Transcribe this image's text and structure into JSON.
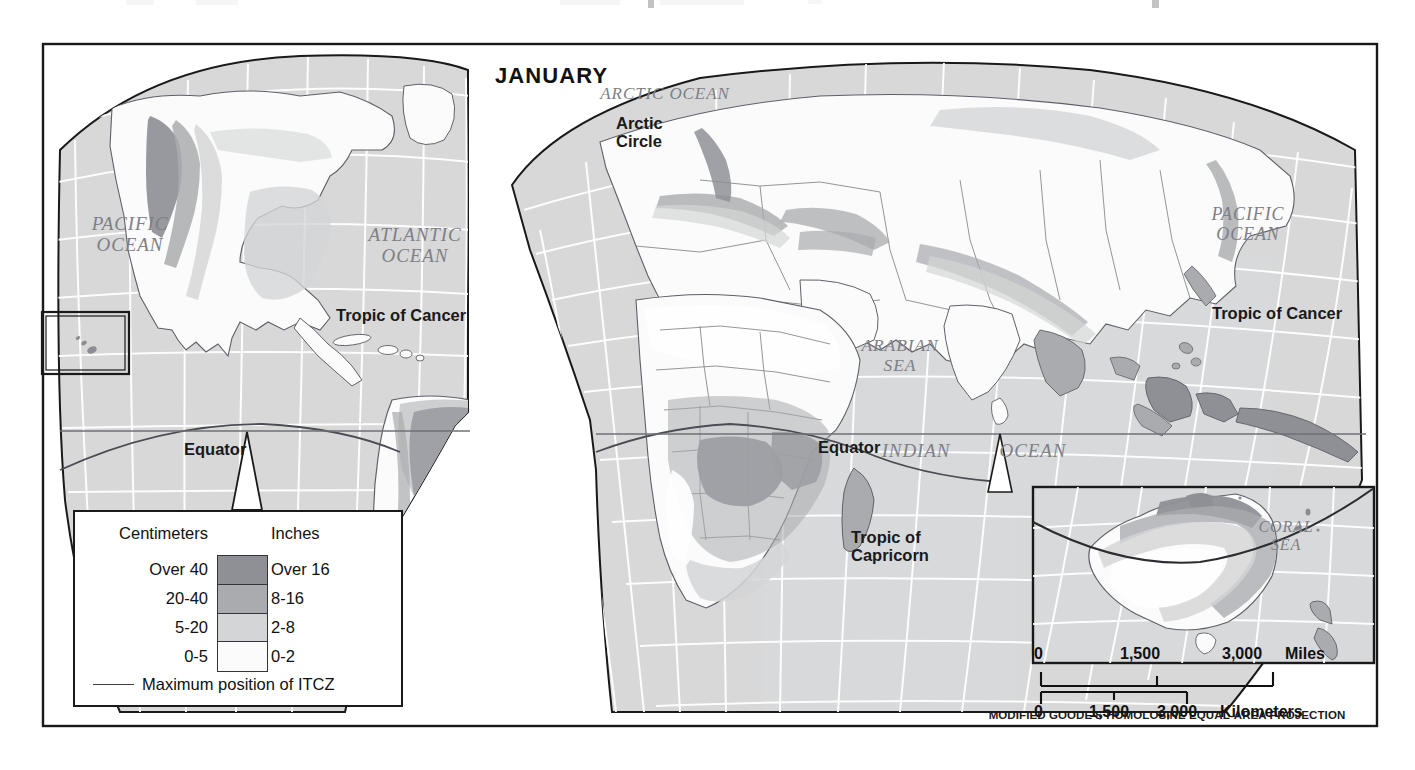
{
  "map": {
    "title": "JANUARY",
    "projection_note": "MODIFIED GOODE'S HOMOLOSINE EQUAL-AREA PROJECTION",
    "ocean_labels": [
      {
        "name": "pacific-ocean-left",
        "text": "PACIFIC\nOCEAN",
        "x": 95,
        "y": 243
      },
      {
        "name": "atlantic-ocean",
        "text": "ATLANTIC\nOCEAN",
        "x": 368,
        "y": 252
      },
      {
        "name": "arctic-ocean",
        "text": "ARCTIC OCEAN",
        "x": 660,
        "y": 94
      },
      {
        "name": "arabian-sea",
        "text": "ARABIAN\nSEA",
        "x": 880,
        "y": 350
      },
      {
        "name": "indian-ocean-word-indian",
        "text": "INDIAN",
        "x": 912,
        "y": 450
      },
      {
        "name": "indian-ocean-word-ocean",
        "text": "OCEAN",
        "x": 1025,
        "y": 450
      },
      {
        "name": "pacific-ocean-right",
        "text": "PACIFIC\nOCEAN",
        "x": 1236,
        "y": 220
      },
      {
        "name": "coral-sea",
        "text": "CORAL\nSEA",
        "x": 1281,
        "y": 533
      }
    ],
    "feature_labels": [
      {
        "name": "arctic-circle",
        "text": "Arctic\nCircle",
        "x": 642,
        "y": 122
      },
      {
        "name": "tropic-of-cancer-left",
        "text": "Tropic of Cancer",
        "x": 336,
        "y": 313
      },
      {
        "name": "tropic-of-cancer-right",
        "text": "Tropic of Cancer",
        "x": 1212,
        "y": 312
      },
      {
        "name": "equator-left",
        "text": "Equator",
        "x": 184,
        "y": 443
      },
      {
        "name": "equator-right",
        "text": "Equator",
        "x": 818,
        "y": 441
      },
      {
        "name": "tropic-of-capricorn",
        "text": "Tropic of\nCapricorn",
        "x": 851,
        "y": 535
      }
    ]
  },
  "legend": {
    "heading_left": "Centimeters",
    "heading_right": "Inches",
    "classes": [
      {
        "cm": "Over 40",
        "inches": "Over 16",
        "color": "#8e9096"
      },
      {
        "cm": "20-40",
        "inches": "8-16",
        "color": "#a9abae"
      },
      {
        "cm": "5-20",
        "inches": "2-8",
        "color": "#d4d5d6"
      },
      {
        "cm": "0-5",
        "inches": "0-2",
        "color": "#fbfbfb"
      }
    ],
    "itcz_label": "Maximum position of ITCZ"
  },
  "scale": {
    "miles": {
      "unit_label": "Miles",
      "ticks": [
        "0",
        "1,500",
        "3,000"
      ]
    },
    "kilometers": {
      "unit_label": "Kilometers",
      "ticks": [
        "0",
        "1,500",
        "3,000"
      ]
    }
  },
  "colors": {
    "ocean_fill": "#d8d9da",
    "land_light": "#fbfbfb",
    "class_5_20": "#d4d5d6",
    "class_20_40": "#a9abae",
    "class_over_40": "#8e9096",
    "frame": "#1a1a1a",
    "graticule": "#ffffff",
    "coastline": "#5d6068",
    "itcz": "#3b3d42"
  }
}
